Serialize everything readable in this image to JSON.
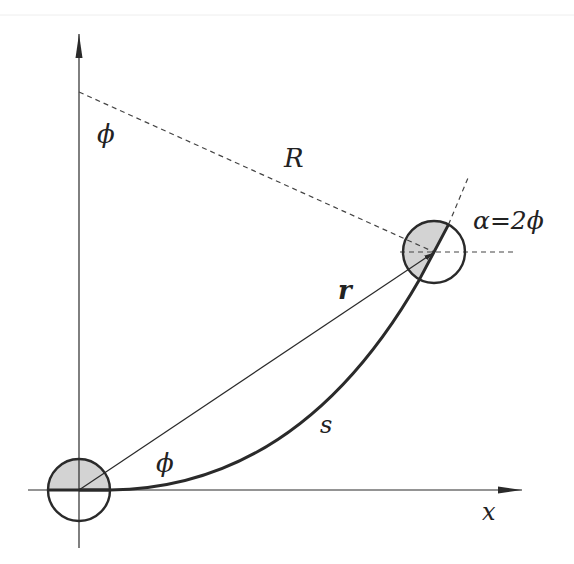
{
  "diagram": {
    "labels": {
      "phi_top": "ϕ",
      "R": "R",
      "alpha": "α=2ϕ",
      "r": "r",
      "s": "s",
      "phi_bottom": "ϕ",
      "x_axis": "x"
    },
    "colors": {
      "line": "#2a2a2a",
      "dashed": "#444444",
      "shade": "#cfcfcf",
      "background": "#ffffff"
    },
    "elements": {
      "origin_circle": {
        "cx": 79,
        "cy": 490,
        "r": 31,
        "shaded": "upper-half"
      },
      "end_circle": {
        "cx": 434,
        "cy": 252,
        "r": 31,
        "shaded": "left-of-tangent"
      },
      "y_axis": {
        "x": 79,
        "from_y": 548,
        "to_y": 34
      },
      "x_axis": {
        "y": 490,
        "from_x": 28,
        "to_x": 522
      },
      "center_of_curvature": {
        "x": 79,
        "y": 92
      }
    }
  }
}
